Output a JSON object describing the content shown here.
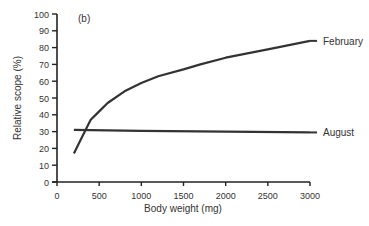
{
  "chart_data": {
    "type": "line",
    "title": "",
    "panel_label": "(b)",
    "xlabel": "Body weight (mg)",
    "ylabel": "Relative scope (%)",
    "xlim": [
      0,
      3000
    ],
    "ylim": [
      0,
      100
    ],
    "x_ticks": [
      0,
      500,
      1000,
      1500,
      2000,
      2500,
      3000
    ],
    "y_ticks": [
      0,
      10,
      20,
      30,
      40,
      50,
      60,
      70,
      80,
      90,
      100
    ],
    "grid": false,
    "legend": "inline labels at line ends",
    "series": [
      {
        "name": "February",
        "x": [
          200,
          300,
          400,
          500,
          600,
          800,
          1000,
          1200,
          1500,
          1700,
          2000,
          2500,
          3000
        ],
        "y": [
          17,
          27,
          37,
          42,
          47,
          54,
          59,
          63,
          67,
          70,
          74,
          79,
          84
        ]
      },
      {
        "name": "August",
        "x": [
          200,
          1000,
          2000,
          3000
        ],
        "y": [
          31,
          30.5,
          30,
          29.5
        ]
      }
    ]
  }
}
